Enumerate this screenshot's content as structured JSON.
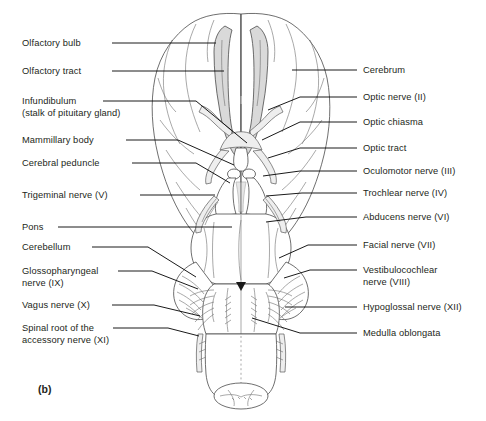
{
  "figure": {
    "panel_letter": "(b)",
    "view": "inferior view of the brain",
    "colors": {
      "text": "#231f20",
      "leader_line": "#000000",
      "outline": "#4a4a4a",
      "shading": "#d9d9d9",
      "background": "#ffffff"
    }
  },
  "labels_left": [
    {
      "id": "olfactory-bulb",
      "text": "Olfactory bulb",
      "x": 22,
      "y": 38,
      "line": [
        [
          112,
          43
        ],
        [
          216,
          43
        ]
      ]
    },
    {
      "id": "olfactory-tract",
      "text": "Olfactory tract",
      "x": 22,
      "y": 66,
      "line": [
        [
          112,
          71
        ],
        [
          224,
          71
        ]
      ]
    },
    {
      "id": "infundibulum",
      "text": "Infundibulum",
      "x": 22,
      "y": 96,
      "line": [
        [
          103,
          101
        ],
        [
          196,
          101
        ],
        [
          247,
          143
        ]
      ]
    },
    {
      "id": "infundibulum-sub",
      "text": "(stalk of pituitary gland)",
      "x": 22,
      "y": 108,
      "line": null
    },
    {
      "id": "mammillary-body",
      "text": "Mammillary body",
      "x": 22,
      "y": 135,
      "line": [
        [
          126,
          140
        ],
        [
          178,
          140
        ],
        [
          234,
          165
        ]
      ]
    },
    {
      "id": "cerebral-peduncle",
      "text": "Cerebral peduncle",
      "x": 22,
      "y": 158,
      "line": [
        [
          132,
          163
        ],
        [
          196,
          163
        ],
        [
          230,
          183
        ]
      ]
    },
    {
      "id": "trigeminal-nerve",
      "text": "Trigeminal nerve (V)",
      "x": 22,
      "y": 190,
      "line": [
        [
          140,
          195
        ],
        [
          215,
          195
        ]
      ]
    },
    {
      "id": "pons",
      "text": "Pons",
      "x": 22,
      "y": 222,
      "line": [
        [
          58,
          227
        ],
        [
          232,
          227
        ]
      ]
    },
    {
      "id": "cerebellum",
      "text": "Cerebellum",
      "x": 22,
      "y": 242,
      "line": [
        [
          92,
          247
        ],
        [
          148,
          247
        ],
        [
          196,
          277
        ]
      ]
    },
    {
      "id": "glossopharyngeal",
      "text": "Glossopharyngeal",
      "x": 22,
      "y": 266,
      "line": [
        [
          118,
          271
        ],
        [
          152,
          271
        ],
        [
          198,
          289
        ]
      ]
    },
    {
      "id": "glossopharyngeal-sub",
      "text": "nerve (IX)",
      "x": 22,
      "y": 278,
      "line": null
    },
    {
      "id": "vagus-nerve",
      "text": "Vagus nerve (X)",
      "x": 22,
      "y": 300,
      "line": [
        [
          112,
          305
        ],
        [
          154,
          305
        ],
        [
          200,
          316
        ]
      ]
    },
    {
      "id": "spinal-root",
      "text": "Spinal root of the",
      "x": 22,
      "y": 323,
      "line": [
        [
          113,
          328
        ],
        [
          168,
          328
        ],
        [
          199,
          336
        ]
      ]
    },
    {
      "id": "spinal-root-sub",
      "text": "accessory nerve (XI)",
      "x": 22,
      "y": 335,
      "line": null
    }
  ],
  "labels_right": [
    {
      "id": "cerebrum",
      "text": "Cerebrum",
      "x": 363,
      "y": 65,
      "line": [
        [
          357,
          70
        ],
        [
          292,
          70
        ]
      ]
    },
    {
      "id": "optic-nerve",
      "text": "Optic nerve (II)",
      "x": 363,
      "y": 92,
      "line": [
        [
          357,
          97
        ],
        [
          300,
          97
        ],
        [
          268,
          110
        ]
      ]
    },
    {
      "id": "optic-chiasma",
      "text": "Optic chiasma",
      "x": 363,
      "y": 117,
      "line": [
        [
          357,
          122
        ],
        [
          300,
          122
        ],
        [
          262,
          140
        ]
      ]
    },
    {
      "id": "optic-tract",
      "text": "Optic tract",
      "x": 363,
      "y": 143,
      "line": [
        [
          357,
          148
        ],
        [
          300,
          148
        ],
        [
          268,
          158
        ]
      ]
    },
    {
      "id": "oculomotor-nerve",
      "text": "Oculomotor nerve (III)",
      "x": 363,
      "y": 166,
      "line": [
        [
          357,
          171
        ],
        [
          300,
          171
        ],
        [
          263,
          176
        ]
      ]
    },
    {
      "id": "trochlear-nerve",
      "text": "Trochlear nerve (IV)",
      "x": 363,
      "y": 188,
      "line": [
        [
          357,
          193
        ],
        [
          302,
          193
        ],
        [
          266,
          196
        ]
      ]
    },
    {
      "id": "abducens-nerve",
      "text": "Abducens nerve (VI)",
      "x": 363,
      "y": 212,
      "line": [
        [
          357,
          217
        ],
        [
          306,
          217
        ],
        [
          266,
          222
        ]
      ]
    },
    {
      "id": "facial-nerve",
      "text": "Facial nerve (VII)",
      "x": 363,
      "y": 240,
      "line": [
        [
          357,
          245
        ],
        [
          308,
          245
        ],
        [
          279,
          258
        ]
      ]
    },
    {
      "id": "vestibulocochlear",
      "text": "Vestibulocochlear",
      "x": 363,
      "y": 265,
      "line": [
        [
          357,
          270
        ],
        [
          310,
          270
        ],
        [
          284,
          278
        ]
      ]
    },
    {
      "id": "vestibulocochlear-sub",
      "text": "nerve (VIII)",
      "x": 363,
      "y": 277,
      "line": null
    },
    {
      "id": "hypoglossal-nerve",
      "text": "Hypoglossal nerve (XII)",
      "x": 363,
      "y": 302,
      "line": [
        [
          357,
          307
        ],
        [
          285,
          307
        ]
      ]
    },
    {
      "id": "medulla-oblongata",
      "text": "Medulla oblongata",
      "x": 363,
      "y": 328,
      "line": [
        [
          357,
          333
        ],
        [
          300,
          333
        ],
        [
          252,
          318
        ]
      ]
    }
  ]
}
